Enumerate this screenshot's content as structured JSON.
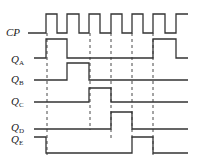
{
  "diagram": {
    "type": "timing-diagram",
    "signals": [
      {
        "name": "CP",
        "main": "CP",
        "sub": "",
        "label_y": 36,
        "points": "28,33 46,33 46,14 57,14 57,33 67,33 67,14 79,14 79,33 89,33 89,14 100,14 100,33 111,33 111,14 122,14 122,33 132,33 132,14 143,14 143,33 153,33 153,14 165,14 165,33 176,33 176,14 188,14"
      },
      {
        "name": "QA",
        "main": "Q",
        "sub": "A",
        "label_y": 63,
        "points": "34,58 46,58 46,39 67,39 67,58 153,58 153,39 176,39 176,58 188,58"
      },
      {
        "name": "QB",
        "main": "Q",
        "sub": "B",
        "label_y": 83,
        "points": "34,80 67,80 67,63 89,63 89,80 188,80"
      },
      {
        "name": "QC",
        "main": "Q",
        "sub": "C",
        "label_y": 105,
        "points": "34,102 89,102 89,88 111,88 111,102 188,102"
      },
      {
        "name": "QD",
        "main": "Q",
        "sub": "D",
        "label_y": 131,
        "points": "34,129 111,129 111,112 132,112 132,129 188,129"
      },
      {
        "name": "QE",
        "main": "Q",
        "sub": "E",
        "label_y": 146,
        "points": "34,137 46,137 46,153 132,153 132,137 153,137 153,153 188,153"
      }
    ],
    "dashed_lines_x": [
      47,
      90,
      111,
      132,
      153
    ],
    "dashed_y_range": [
      33,
      155
    ]
  }
}
